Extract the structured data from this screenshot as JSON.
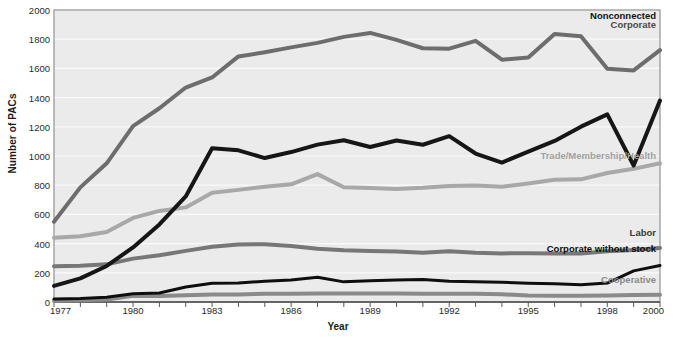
{
  "chart_data": {
    "type": "line",
    "title": "",
    "xlabel": "Year",
    "ylabel": "Number of PACs",
    "xlim": [
      1977,
      2000
    ],
    "ylim": [
      0,
      2000
    ],
    "grid": true,
    "legend_position": "inline-right-of-line-end",
    "x": [
      1977,
      1978,
      1979,
      1980,
      1981,
      1982,
      1983,
      1984,
      1985,
      1986,
      1987,
      1988,
      1989,
      1990,
      1991,
      1992,
      1993,
      1994,
      1995,
      1996,
      1997,
      1998,
      1999,
      2000
    ],
    "xticks": [
      "1977",
      "1980",
      "1983",
      "1986",
      "1989",
      "1992",
      "1995",
      "1998",
      "2000"
    ],
    "yticks": [
      "0",
      "200",
      "400",
      "600",
      "800",
      "1000",
      "1200",
      "1400",
      "1600",
      "1800",
      "2000"
    ],
    "series": [
      {
        "name": "Corporate",
        "color": "#6d6d6d",
        "width": 4,
        "label_color": "#4a4a4a",
        "label_weight": "bold",
        "values": [
          550,
          785,
          950,
          1204,
          1327,
          1469,
          1538,
          1682,
          1710,
          1744,
          1775,
          1816,
          1843,
          1795,
          1738,
          1735,
          1789,
          1660,
          1674,
          1836,
          1821,
          1597,
          1586,
          1725
        ]
      },
      {
        "name": "Nonconnected",
        "color": "#161616",
        "width": 4,
        "label_color": "#111111",
        "label_weight": "bold",
        "values": [
          110,
          162,
          247,
          374,
          531,
          723,
          1053,
          1039,
          986,
          1027,
          1078,
          1108,
          1062,
          1106,
          1077,
          1136,
          1017,
          955,
          1030,
          1103,
          1201,
          1285,
          935,
          1380
        ]
      },
      {
        "name": "Trade/Membership/Health",
        "color": "#a8a8a8",
        "width": 4,
        "label_color": "#a0a0a0",
        "label_weight": "bold",
        "values": [
          440,
          450,
          480,
          576,
          624,
          648,
          748,
          768,
          790,
          806,
          876,
          786,
          780,
          774,
          782,
          795,
          798,
          790,
          812,
          838,
          840,
          884,
          912,
          950
        ]
      },
      {
        "name": "Labor",
        "color": "#777777",
        "width": 4,
        "label_color": "#3a3a3a",
        "label_weight": "bold",
        "values": [
          245,
          248,
          258,
          297,
          320,
          350,
          378,
          394,
          396,
          384,
          364,
          354,
          349,
          346,
          338,
          347,
          337,
          333,
          334,
          332,
          332,
          347,
          356,
          370
        ]
      },
      {
        "name": "Corporate without stock",
        "color": "#0e0e0e",
        "width": 3,
        "label_color": "#0e0e0e",
        "label_weight": "bold",
        "values": [
          20,
          24,
          32,
          56,
          62,
          103,
          129,
          130,
          142,
          151,
          170,
          138,
          146,
          150,
          154,
          142,
          139,
          136,
          129,
          125,
          118,
          130,
          213,
          250
        ]
      },
      {
        "name": "Cooperative",
        "color": "#8a8a8a",
        "width": 4,
        "label_color": "#8a8a8a",
        "label_weight": "bold",
        "values": [
          8,
          12,
          17,
          42,
          41,
          47,
          52,
          52,
          56,
          56,
          59,
          59,
          59,
          59,
          56,
          56,
          56,
          53,
          44,
          43,
          42,
          45,
          48,
          50
        ]
      }
    ]
  },
  "labels": {
    "corporate": "Corporate",
    "nonconnected": "Nonconnected",
    "trade": "Trade/Membership/Health",
    "labor": "Labor",
    "corporate_without_stock": "Corporate without stock",
    "cooperative": "Cooperative"
  },
  "axes": {
    "y_title": "Number of PACs",
    "x_title": "Year"
  },
  "colors": {
    "plot_background": "#ebebeb",
    "gridline": "#fafafa",
    "axis_line": "#9a9a9a",
    "text": "#2a2a2a"
  }
}
